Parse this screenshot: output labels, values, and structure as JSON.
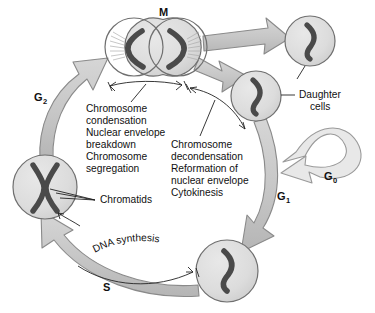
{
  "diagram": {
    "type": "cycle-diagram",
    "colors": {
      "arrow_fill": "#c9c9c9",
      "arrow_stroke": "#8a8a8a",
      "cell_fill": "#dcdcdc",
      "cell_stroke": "#6f6f6f",
      "chromosome": "#4a4a4a",
      "text": "#111111",
      "background": "#ffffff",
      "g0_fill": "#e6e6e6"
    }
  },
  "phases": [
    {
      "id": "M",
      "label": "M",
      "sub": "",
      "x": 159,
      "y": 16,
      "note": "mitosis - dividing cell at top"
    },
    {
      "id": "G2",
      "label": "G",
      "sub": "2",
      "x": 40,
      "y": 101,
      "note": "gap 2 - left side"
    },
    {
      "id": "G1",
      "label": "G",
      "sub": "1",
      "x": 283,
      "y": 200,
      "note": "gap 1 - right side"
    },
    {
      "id": "G0",
      "label": "G",
      "sub": "0",
      "x": 330,
      "y": 180,
      "note": "quiescent state loop"
    },
    {
      "id": "S",
      "label": "S",
      "sub": "",
      "x": 106,
      "y": 291,
      "note": "DNA synthesis - bottom"
    }
  ],
  "text_blocks": {
    "left": {
      "name": "m-phase-events",
      "lines": [
        "Chromosome",
        "condensation",
        "Nuclear envelope",
        "breakdown",
        "Chromosome",
        "segregation"
      ]
    },
    "right": {
      "name": "telophase-events",
      "lines": [
        "Chromosome",
        "decondensation",
        "Reformation of",
        "nuclear envelope",
        "Cytokinesis"
      ]
    }
  },
  "labels": {
    "daughter_cells": {
      "lines": [
        "Daughter",
        "cells"
      ]
    },
    "chromatids": {
      "text": "Chromatids"
    },
    "dna_synthesis": {
      "text": "DNA synthesis"
    }
  },
  "cells": [
    {
      "id": "m-left",
      "cx": 134,
      "cy": 47,
      "r": 29,
      "chromosome": "left-bracket",
      "spindle": true
    },
    {
      "id": "m-right",
      "cx": 178,
      "cy": 47,
      "r": 29,
      "chromosome": "right-bracket",
      "spindle": true
    },
    {
      "id": "daughter-top",
      "cx": 310,
      "cy": 41,
      "r": 25,
      "chromosome": "single-curve",
      "spindle": false
    },
    {
      "id": "daughter-lower",
      "cx": 256,
      "cy": 96,
      "r": 25,
      "chromosome": "single-curve",
      "spindle": false
    },
    {
      "id": "g1-s-cell",
      "cx": 227,
      "cy": 271,
      "r": 31,
      "chromosome": "single-curve",
      "spindle": false
    },
    {
      "id": "g2-cell",
      "cx": 45,
      "cy": 187,
      "r": 32,
      "chromosome": "x-shape",
      "spindle": false
    }
  ]
}
